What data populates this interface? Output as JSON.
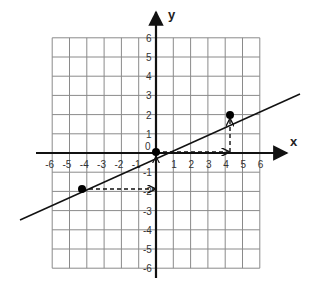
{
  "chart_data": {
    "type": "line",
    "title": "",
    "xlabel": "x",
    "ylabel": "y",
    "xlim": [
      -6,
      6
    ],
    "ylim": [
      -6,
      6
    ],
    "grid": true,
    "x_ticks": [
      "-6",
      "-5",
      "-4",
      "-3",
      "-2",
      "-1",
      "1",
      "2",
      "3",
      "4",
      "5",
      "6"
    ],
    "y_ticks": [
      "6",
      "5",
      "4",
      "3",
      "2",
      "1",
      "0",
      "-1",
      "-2",
      "-3",
      "-4",
      "-5",
      "-6"
    ],
    "origin_label": "0",
    "series": [
      {
        "name": "line y = 0.5x",
        "slope": 0.5,
        "intercept": 0,
        "x": [
          -8,
          8
        ],
        "y": [
          -4,
          4
        ]
      }
    ],
    "points": [
      {
        "x": -4,
        "y": -2
      },
      {
        "x": 0,
        "y": 0
      },
      {
        "x": 4,
        "y": 2
      }
    ],
    "annotations": [
      {
        "type": "dashed-arrow",
        "from": [
          0,
          0
        ],
        "to": [
          4,
          0
        ],
        "meaning": "run of 4"
      },
      {
        "type": "dashed-arrow",
        "from": [
          4,
          0
        ],
        "to": [
          4,
          2
        ],
        "meaning": "rise of 2"
      },
      {
        "type": "dashed-arrow",
        "from": [
          -4,
          -2
        ],
        "to": [
          0,
          -2
        ],
        "meaning": "run of 4"
      },
      {
        "type": "arrow",
        "from": [
          0,
          -2
        ],
        "to": [
          0,
          0
        ],
        "meaning": "rise of 2"
      }
    ]
  },
  "labels": {
    "x_axis": "x",
    "y_axis": "y",
    "origin": "0"
  },
  "colors": {
    "grid": "#8a8a8a",
    "axis": "#111111",
    "line": "#111111",
    "point": "#000000"
  }
}
